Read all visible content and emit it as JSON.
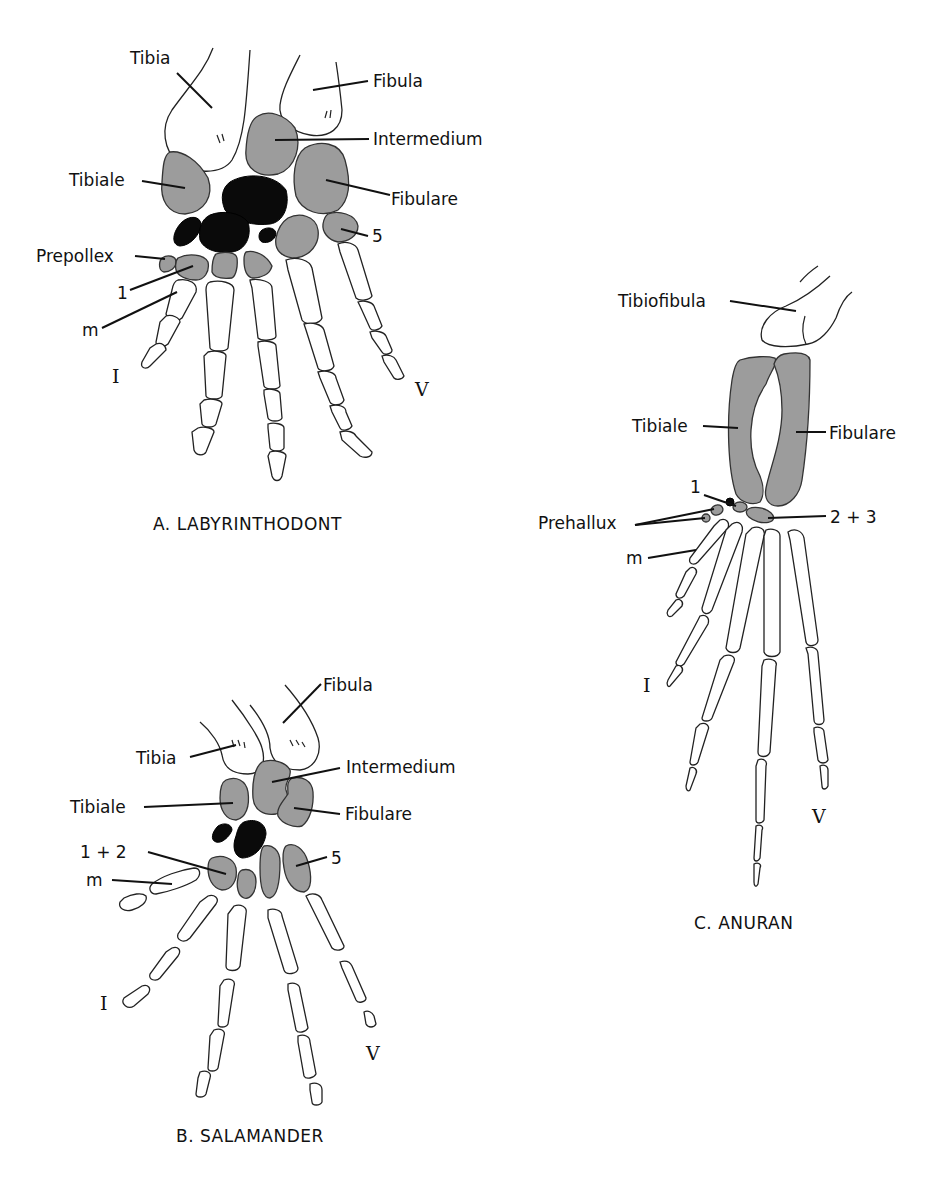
{
  "colors": {
    "background": "#ffffff",
    "bone_fill": "#ffffff",
    "cartilage_gray": "#9c9c9c",
    "centralia_black": "#0a0a0a",
    "ink": "#111111"
  },
  "panels": {
    "labyrinthodont": {
      "caption": "A. LABYRINTHODONT",
      "labels": {
        "tibia": "Tibia",
        "fibula": "Fibula",
        "intermedium": "Intermedium",
        "tibiale": "Tibiale",
        "fibulare": "Fibulare",
        "tarsal5": "5",
        "prepollex": "Prepollex",
        "tarsal1": "1",
        "metatarsal": "m",
        "digit_first": "I",
        "digit_fifth": "V"
      }
    },
    "salamander": {
      "caption": "B. SALAMANDER",
      "labels": {
        "fibula": "Fibula",
        "tibia": "Tibia",
        "intermedium": "Intermedium",
        "tibiale": "Tibiale",
        "fibulare": "Fibulare",
        "tarsal12": "1 + 2",
        "tarsal5": "5",
        "metatarsal": "m",
        "digit_first": "I",
        "digit_fifth": "V"
      }
    },
    "anuran": {
      "caption": "C. ANURAN",
      "labels": {
        "tibiofibula": "Tibiofibula",
        "tibiale": "Tibiale",
        "fibulare": "Fibulare",
        "tarsal1": "1",
        "prehallux": "Prehallux",
        "tarsal23": "2 + 3",
        "metatarsal": "m",
        "digit_first": "I",
        "digit_fifth": "V"
      }
    }
  }
}
